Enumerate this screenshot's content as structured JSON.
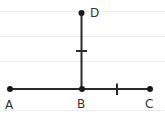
{
  "diagram": {
    "type": "geometry",
    "background": "#ffffff",
    "rule_line_color": "#ececec",
    "stroke_color": "#2a2a2a",
    "points": [
      {
        "id": "A",
        "label": "A",
        "x": 10,
        "y": 89
      },
      {
        "id": "B",
        "label": "B",
        "x": 82,
        "y": 89
      },
      {
        "id": "C",
        "label": "C",
        "x": 150,
        "y": 89
      },
      {
        "id": "D",
        "label": "D",
        "x": 81,
        "y": 13
      }
    ],
    "segments": [
      {
        "from": "A",
        "to": "C"
      },
      {
        "from": "B",
        "to": "D"
      }
    ],
    "tick_marks": [
      {
        "segment": "BD",
        "count": 1
      },
      {
        "segment": "BC",
        "count": 1
      }
    ],
    "note": "BD and BC marked congruent; BD perpendicular to AC at B"
  }
}
